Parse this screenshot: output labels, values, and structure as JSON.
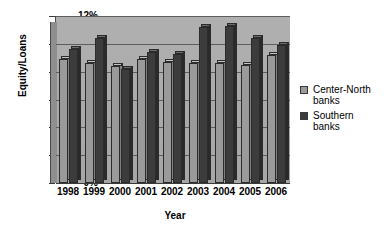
{
  "chart_data": {
    "type": "bar",
    "title": "",
    "xlabel": "Year",
    "ylabel": "Equity/Loans",
    "categories": [
      "1998",
      "1999",
      "2000",
      "2001",
      "2002",
      "2003",
      "2004",
      "2005",
      "2006"
    ],
    "ylim": [
      0,
      12
    ],
    "yticks": [
      "0%",
      "2%",
      "4%",
      "6%",
      "8%",
      "10%",
      "12%"
    ],
    "ytick_values": [
      0,
      2,
      4,
      6,
      8,
      10,
      12
    ],
    "yunit": "%",
    "grid": true,
    "legend_position": "right",
    "series": [
      {
        "name": "Center-North banks",
        "color": "#9a9a9a",
        "values": [
          8.9,
          8.6,
          8.4,
          8.9,
          8.7,
          8.6,
          8.6,
          8.5,
          9.2
        ]
      },
      {
        "name": "Southern banks",
        "color": "#3c3c3c",
        "values": [
          9.6,
          10.4,
          8.2,
          9.4,
          9.3,
          11.2,
          11.3,
          10.4,
          9.9
        ]
      }
    ]
  },
  "legend": {
    "entries": [
      {
        "label_line1": "Center-North",
        "label_line2": "banks"
      },
      {
        "label_line1": "Southern",
        "label_line2": "banks"
      }
    ]
  },
  "axes": {
    "y_title": "Equity/Loans",
    "x_title": "Year"
  },
  "colors": {
    "plot_background": "#a9a9a9",
    "gridline": "#5d5d5d",
    "series_light": "#9a9a9a",
    "series_dark": "#3c3c3c",
    "text": "#000000"
  }
}
